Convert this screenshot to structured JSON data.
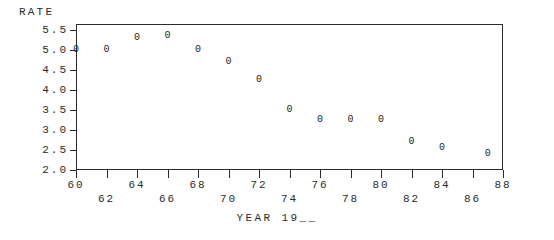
{
  "chart_data": {
    "type": "scatter",
    "title": "",
    "subtitle": "",
    "xlabel": "YEAR 19__",
    "ylabel": "RATE",
    "marker_glyph": "0",
    "grid": false,
    "legend": null,
    "xlim": [
      60,
      88
    ],
    "ylim": [
      2.0,
      5.5
    ],
    "x_tick_values": [
      60,
      62,
      64,
      66,
      68,
      70,
      72,
      74,
      76,
      78,
      80,
      82,
      84,
      86,
      88
    ],
    "x_tick_labels": [
      "60",
      "62",
      "64",
      "66",
      "68",
      "70",
      "72",
      "74",
      "76",
      "78",
      "80",
      "82",
      "84",
      "86",
      "88"
    ],
    "x_tick_label_rows": [
      "upper",
      "lower",
      "upper",
      "lower",
      "upper",
      "lower",
      "upper",
      "lower",
      "upper",
      "lower",
      "upper",
      "lower",
      "upper",
      "lower",
      "upper"
    ],
    "y_tick_values": [
      5.5,
      5.0,
      4.5,
      4.0,
      3.5,
      3.0,
      2.5,
      2.0
    ],
    "y_tick_labels": [
      "5.5",
      "5.0",
      "4.5",
      "4.0",
      "3.5",
      "3.0",
      "2.5",
      "2.0"
    ],
    "x": [
      60,
      62,
      64,
      66,
      68,
      70,
      72,
      74,
      76,
      78,
      80,
      82,
      84,
      87
    ],
    "y": [
      5.0,
      5.0,
      5.3,
      5.35,
      5.0,
      4.7,
      4.25,
      3.5,
      3.25,
      3.25,
      3.25,
      2.7,
      2.55,
      2.4
    ],
    "points": [
      {
        "x": 60,
        "y": 5.0
      },
      {
        "x": 62,
        "y": 5.0
      },
      {
        "x": 64,
        "y": 5.3
      },
      {
        "x": 66,
        "y": 5.35
      },
      {
        "x": 68,
        "y": 5.0
      },
      {
        "x": 70,
        "y": 4.7
      },
      {
        "x": 72,
        "y": 4.25
      },
      {
        "x": 74,
        "y": 3.5
      },
      {
        "x": 76,
        "y": 3.25
      },
      {
        "x": 78,
        "y": 3.25
      },
      {
        "x": 80,
        "y": 3.25
      },
      {
        "x": 82,
        "y": 2.7
      },
      {
        "x": 84,
        "y": 2.55
      },
      {
        "x": 87,
        "y": 2.4
      }
    ]
  },
  "colors": {
    "axis": "#2b2b2b",
    "marker": "#242424",
    "background": "#ffffff"
  }
}
